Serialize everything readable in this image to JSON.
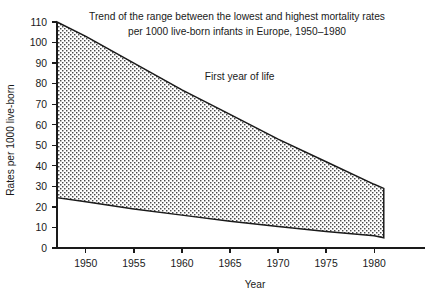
{
  "chart_data": {
    "type": "area",
    "title": "Trend of the range between the lowest and highest mortality rates per 1000 live-born infants in Europe, 1950–1980",
    "title_line1": "Trend of the range between the lowest and highest mortality rates",
    "title_line2": "per 1000 live-born infants in Europe, 1950–1980",
    "xlabel": "Year",
    "ylabel": "Rates per 1000 live-born",
    "xlim": [
      1947,
      1983
    ],
    "ylim": [
      0,
      110
    ],
    "grid": false,
    "legend": "none",
    "annotations": [
      {
        "text": "First year of life",
        "x": 1966,
        "y": 82
      }
    ],
    "xticks": [
      1950,
      1955,
      1960,
      1965,
      1970,
      1975,
      1980
    ],
    "xtick_labels": [
      "1950",
      "1955",
      "1960",
      "1965",
      "1970",
      "1975",
      "1980"
    ],
    "yticks": [
      0,
      10,
      20,
      30,
      40,
      50,
      60,
      70,
      80,
      90,
      100,
      110
    ],
    "ytick_labels": [
      "0",
      "10",
      "20",
      "30",
      "40",
      "50",
      "60",
      "70",
      "80",
      "90",
      "100",
      "110"
    ],
    "x": [
      1947,
      1950,
      1955,
      1960,
      1965,
      1970,
      1975,
      1980,
      1981
    ],
    "series": [
      {
        "name": "Highest mortality rate",
        "values": [
          110,
          103,
          90,
          77,
          65,
          53,
          42,
          31,
          29
        ]
      },
      {
        "name": "Lowest mortality rate",
        "values": [
          24.5,
          22.5,
          19,
          16,
          13,
          10.5,
          8,
          6,
          5
        ]
      }
    ],
    "band_fill": "stipple-dot-pattern",
    "colors": {
      "axis": "#1a1a1a",
      "outline": "#1a1a1a",
      "fill_dot": "#3a3a3a",
      "background": "#ffffff"
    }
  }
}
